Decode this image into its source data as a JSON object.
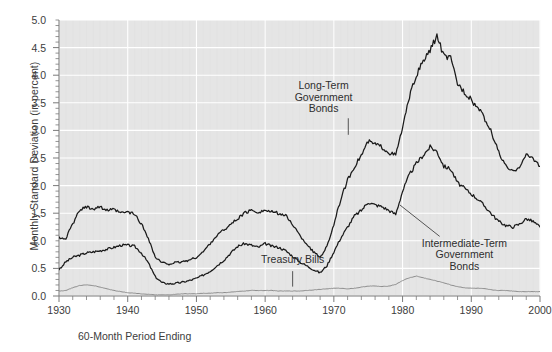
{
  "chart_data": {
    "type": "line",
    "title": "",
    "xlabel": "60-Month Period Ending",
    "ylabel": "Monthly Standard Deviation (in percent)",
    "xlim": [
      1930,
      2000
    ],
    "ylim": [
      0.0,
      5.0
    ],
    "grid": true,
    "legend_position": "inline-annotations",
    "ytick_labels": [
      "0.0",
      "0.5",
      "1.0",
      "1.5",
      "2.0",
      "2.5",
      "3.0",
      "3.5",
      "4.0",
      "4.5",
      "5.0"
    ],
    "ytick_values": [
      0.0,
      0.5,
      1.0,
      1.5,
      2.0,
      2.5,
      3.0,
      3.5,
      4.0,
      4.5,
      5.0
    ],
    "xtick_labels": [
      "1930",
      "1940",
      "1950",
      "1960",
      "1970",
      "1980",
      "1990",
      "2000"
    ],
    "xtick_values": [
      1930,
      1940,
      1950,
      1960,
      1970,
      1980,
      1990,
      2000
    ],
    "minor_tick_interval": 2,
    "annotations": [
      {
        "text": "Long-Term Government Bonds",
        "lines": [
          "Long-Term",
          "Government",
          "Bonds"
        ],
        "x": 1968.5,
        "y": 3.55
      },
      {
        "text": "Intermediate-Term Government Bonds",
        "lines": [
          "Intermediate-Term",
          "Government",
          "Bonds"
        ],
        "x": 1989.0,
        "y": 0.95
      },
      {
        "text": "Treasury Bills",
        "lines": [
          "Treasury Bills"
        ],
        "x": 1964.0,
        "y": 0.63
      }
    ],
    "series": [
      {
        "name": "Long-Term Government Bonds",
        "color": "#1a1a1a",
        "x": [
          1930,
          1931,
          1932,
          1933,
          1934,
          1935,
          1936,
          1937,
          1938,
          1939,
          1940,
          1941,
          1942,
          1943,
          1944,
          1945,
          1946,
          1947,
          1948,
          1949,
          1950,
          1951,
          1952,
          1953,
          1954,
          1955,
          1956,
          1957,
          1958,
          1959,
          1960,
          1961,
          1962,
          1963,
          1964,
          1965,
          1966,
          1967,
          1968,
          1969,
          1970,
          1971,
          1972,
          1973,
          1974,
          1975,
          1976,
          1977,
          1978,
          1979,
          1980,
          1981,
          1982,
          1983,
          1984,
          1985,
          1986,
          1987,
          1988,
          1989,
          1990,
          1991,
          1992,
          1993,
          1994,
          1995,
          1996,
          1997,
          1998,
          1999,
          2000
        ],
        "values": [
          1.05,
          1.05,
          1.3,
          1.55,
          1.62,
          1.58,
          1.62,
          1.55,
          1.56,
          1.5,
          1.52,
          1.48,
          1.3,
          1.05,
          0.7,
          0.6,
          0.58,
          0.6,
          0.62,
          0.65,
          0.7,
          0.8,
          0.95,
          1.1,
          1.2,
          1.3,
          1.4,
          1.5,
          1.55,
          1.52,
          1.55,
          1.52,
          1.5,
          1.45,
          1.3,
          1.1,
          0.95,
          0.8,
          0.7,
          0.9,
          1.3,
          1.75,
          2.1,
          2.35,
          2.55,
          2.8,
          2.75,
          2.7,
          2.6,
          2.55,
          3.05,
          3.6,
          4.0,
          4.25,
          4.45,
          4.72,
          4.35,
          4.3,
          3.85,
          3.7,
          3.55,
          3.4,
          3.2,
          2.95,
          2.6,
          2.35,
          2.25,
          2.35,
          2.55,
          2.5,
          2.35
        ]
      },
      {
        "name": "Intermediate-Term Government Bonds",
        "color": "#1a1a1a",
        "x": [
          1930,
          1931,
          1932,
          1933,
          1934,
          1935,
          1936,
          1937,
          1938,
          1939,
          1940,
          1941,
          1942,
          1943,
          1944,
          1945,
          1946,
          1947,
          1948,
          1949,
          1950,
          1951,
          1952,
          1953,
          1954,
          1955,
          1956,
          1957,
          1958,
          1959,
          1960,
          1961,
          1962,
          1963,
          1964,
          1965,
          1966,
          1967,
          1968,
          1969,
          1970,
          1971,
          1972,
          1973,
          1974,
          1975,
          1976,
          1977,
          1978,
          1979,
          1980,
          1981,
          1982,
          1983,
          1984,
          1985,
          1986,
          1987,
          1988,
          1989,
          1990,
          1991,
          1992,
          1993,
          1994,
          1995,
          1996,
          1997,
          1998,
          1999,
          2000
        ],
        "values": [
          0.48,
          0.62,
          0.7,
          0.74,
          0.78,
          0.8,
          0.82,
          0.85,
          0.88,
          0.92,
          0.92,
          0.9,
          0.78,
          0.6,
          0.35,
          0.24,
          0.22,
          0.23,
          0.25,
          0.28,
          0.32,
          0.38,
          0.45,
          0.55,
          0.65,
          0.78,
          0.9,
          0.95,
          0.92,
          0.88,
          0.95,
          0.9,
          0.88,
          0.82,
          0.72,
          0.62,
          0.55,
          0.48,
          0.42,
          0.55,
          0.8,
          1.05,
          1.25,
          1.45,
          1.55,
          1.7,
          1.65,
          1.62,
          1.55,
          1.48,
          1.9,
          2.2,
          2.4,
          2.55,
          2.7,
          2.62,
          2.35,
          2.3,
          2.05,
          1.95,
          1.85,
          1.75,
          1.62,
          1.48,
          1.35,
          1.28,
          1.25,
          1.3,
          1.4,
          1.35,
          1.25
        ]
      },
      {
        "name": "Treasury Bills",
        "color": "#8c8c8c",
        "x": [
          1930,
          1931,
          1932,
          1933,
          1934,
          1935,
          1936,
          1937,
          1938,
          1939,
          1940,
          1941,
          1942,
          1943,
          1944,
          1945,
          1946,
          1947,
          1948,
          1949,
          1950,
          1951,
          1952,
          1953,
          1954,
          1955,
          1956,
          1957,
          1958,
          1959,
          1960,
          1961,
          1962,
          1963,
          1964,
          1965,
          1966,
          1967,
          1968,
          1969,
          1970,
          1971,
          1972,
          1973,
          1974,
          1975,
          1976,
          1977,
          1978,
          1979,
          1980,
          1981,
          1982,
          1983,
          1984,
          1985,
          1986,
          1987,
          1988,
          1989,
          1990,
          1991,
          1992,
          1993,
          1994,
          1995,
          1996,
          1997,
          1998,
          1999,
          2000
        ],
        "values": [
          0.09,
          0.1,
          0.15,
          0.19,
          0.2,
          0.19,
          0.16,
          0.13,
          0.1,
          0.08,
          0.06,
          0.05,
          0.04,
          0.03,
          0.02,
          0.02,
          0.02,
          0.03,
          0.04,
          0.04,
          0.04,
          0.05,
          0.05,
          0.06,
          0.06,
          0.07,
          0.08,
          0.09,
          0.1,
          0.1,
          0.1,
          0.1,
          0.09,
          0.09,
          0.09,
          0.09,
          0.1,
          0.11,
          0.12,
          0.13,
          0.14,
          0.14,
          0.13,
          0.14,
          0.16,
          0.18,
          0.18,
          0.17,
          0.18,
          0.21,
          0.28,
          0.33,
          0.36,
          0.33,
          0.3,
          0.27,
          0.24,
          0.2,
          0.17,
          0.15,
          0.14,
          0.14,
          0.13,
          0.11,
          0.1,
          0.1,
          0.09,
          0.08,
          0.08,
          0.08,
          0.08
        ]
      }
    ]
  },
  "figure": {
    "plot_background": "#e5e5e5",
    "gridline_color": "#ffffff",
    "axis_color": "#7a7a7a",
    "page_background": "#ffffff"
  }
}
